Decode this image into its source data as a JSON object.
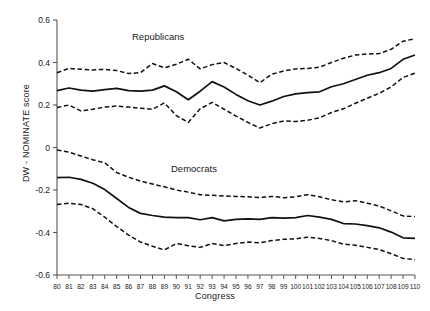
{
  "chart_data": {
    "type": "line",
    "title": "",
    "xlabel": "Congress",
    "ylabel": "DW - NOMINATE score",
    "xlim": [
      80,
      110
    ],
    "ylim": [
      -0.6,
      0.6
    ],
    "grid": false,
    "legend_position": "inline-annotation",
    "x_tick_labels": [
      "80",
      "81",
      "82",
      "83",
      "84",
      "85",
      "86",
      "87",
      "88",
      "89",
      "90",
      "91",
      "92",
      "93",
      "94",
      "95",
      "96",
      "97",
      "98",
      "99",
      "100",
      "101",
      "102",
      "103",
      "104",
      "105",
      "106",
      "107",
      "108",
      "109",
      "110"
    ],
    "y_tick_labels": [
      "0.6",
      "0.4",
      "0.2",
      "0",
      "-0.2",
      "-0.4",
      "-0.6"
    ],
    "y_tick_values": [
      0.6,
      0.4,
      0.2,
      0,
      -0.2,
      -0.4,
      -0.6
    ],
    "x": [
      80,
      81,
      82,
      83,
      84,
      85,
      86,
      87,
      88,
      89,
      90,
      91,
      92,
      93,
      94,
      95,
      96,
      97,
      98,
      99,
      100,
      101,
      102,
      103,
      104,
      105,
      106,
      107,
      108,
      109,
      110
    ],
    "annotations": [
      {
        "name": "Republicans",
        "text": "Republicans",
        "x": 89,
        "y": 0.52
      },
      {
        "name": "Democrats",
        "text": "Democrats",
        "x": 95,
        "y": -0.115
      }
    ],
    "series": [
      {
        "name": "Republicans mean",
        "group": "Republicans",
        "style": "solid",
        "color": "#111111",
        "values": [
          0.268,
          0.28,
          0.27,
          0.265,
          0.272,
          0.278,
          0.268,
          0.265,
          0.27,
          0.29,
          0.262,
          0.225,
          0.265,
          0.31,
          0.285,
          0.25,
          0.22,
          0.2,
          0.218,
          0.24,
          0.252,
          0.258,
          0.262,
          0.286,
          0.3,
          0.32,
          0.34,
          0.352,
          0.372,
          0.415,
          0.435
        ]
      },
      {
        "name": "Republicans upper bound",
        "group": "Republicans",
        "style": "dashed",
        "color": "#111111",
        "values": [
          0.352,
          0.372,
          0.368,
          0.365,
          0.368,
          0.362,
          0.348,
          0.352,
          0.395,
          0.375,
          0.392,
          0.415,
          0.37,
          0.39,
          0.4,
          0.372,
          0.34,
          0.305,
          0.345,
          0.36,
          0.37,
          0.372,
          0.378,
          0.4,
          0.42,
          0.435,
          0.44,
          0.442,
          0.462,
          0.5,
          0.512
        ]
      },
      {
        "name": "Republicans lower bound",
        "group": "Republicans",
        "style": "dashed",
        "color": "#111111",
        "values": [
          0.188,
          0.2,
          0.172,
          0.18,
          0.19,
          0.195,
          0.19,
          0.185,
          0.18,
          0.21,
          0.15,
          0.118,
          0.182,
          0.212,
          0.18,
          0.148,
          0.118,
          0.092,
          0.112,
          0.125,
          0.122,
          0.128,
          0.14,
          0.165,
          0.182,
          0.208,
          0.232,
          0.255,
          0.285,
          0.33,
          0.35
        ]
      },
      {
        "name": "Democrats mean",
        "group": "Democrats",
        "style": "solid",
        "color": "#111111",
        "values": [
          -0.142,
          -0.14,
          -0.15,
          -0.168,
          -0.198,
          -0.24,
          -0.282,
          -0.31,
          -0.32,
          -0.328,
          -0.33,
          -0.33,
          -0.34,
          -0.33,
          -0.345,
          -0.338,
          -0.336,
          -0.338,
          -0.33,
          -0.332,
          -0.33,
          -0.32,
          -0.328,
          -0.338,
          -0.358,
          -0.36,
          -0.368,
          -0.378,
          -0.398,
          -0.425,
          -0.428
        ]
      },
      {
        "name": "Democrats upper bound",
        "group": "Democrats",
        "style": "dashed",
        "color": "#111111",
        "values": [
          -0.012,
          -0.022,
          -0.04,
          -0.058,
          -0.072,
          -0.118,
          -0.14,
          -0.158,
          -0.172,
          -0.185,
          -0.2,
          -0.21,
          -0.222,
          -0.225,
          -0.228,
          -0.23,
          -0.232,
          -0.235,
          -0.23,
          -0.236,
          -0.232,
          -0.222,
          -0.232,
          -0.246,
          -0.256,
          -0.25,
          -0.262,
          -0.275,
          -0.298,
          -0.322,
          -0.325
        ]
      },
      {
        "name": "Democrats lower bound",
        "group": "Democrats",
        "style": "dashed",
        "color": "#111111",
        "values": [
          -0.268,
          -0.262,
          -0.268,
          -0.288,
          -0.328,
          -0.372,
          -0.412,
          -0.445,
          -0.465,
          -0.482,
          -0.452,
          -0.462,
          -0.47,
          -0.452,
          -0.462,
          -0.452,
          -0.445,
          -0.448,
          -0.438,
          -0.432,
          -0.43,
          -0.422,
          -0.428,
          -0.438,
          -0.455,
          -0.46,
          -0.47,
          -0.48,
          -0.5,
          -0.522,
          -0.528
        ]
      }
    ]
  },
  "geometry": {
    "plot_left": 57,
    "plot_right": 415,
    "plot_top": 20,
    "plot_bottom": 275
  }
}
